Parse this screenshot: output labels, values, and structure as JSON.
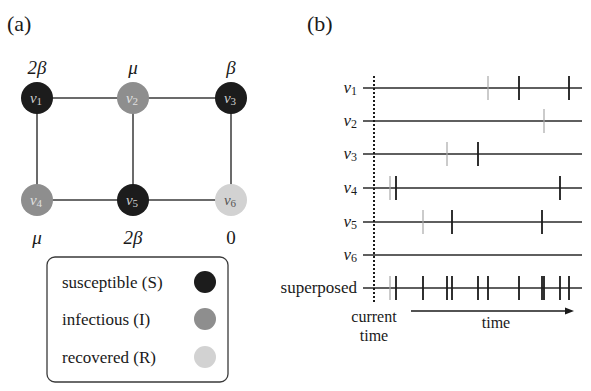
{
  "panel_a": {
    "label": "(a)",
    "colors": {
      "susceptible": "#1c1c1c",
      "infectious": "#8e8e8e",
      "recovered": "#d2d2d2",
      "edge": "#3a3a3a"
    },
    "nodes": [
      {
        "id": "v1",
        "name": "v",
        "sub": "1",
        "state": "susceptible",
        "x": 37,
        "y": 98,
        "rate": "2β",
        "rate_pos": "above"
      },
      {
        "id": "v2",
        "name": "v",
        "sub": "2",
        "state": "infectious",
        "x": 133,
        "y": 98,
        "rate": "μ",
        "rate_pos": "above"
      },
      {
        "id": "v3",
        "name": "v",
        "sub": "3",
        "state": "susceptible",
        "x": 231,
        "y": 98,
        "rate": "β",
        "rate_pos": "above"
      },
      {
        "id": "v4",
        "name": "v",
        "sub": "4",
        "state": "infectious",
        "x": 37,
        "y": 200,
        "rate": "μ",
        "rate_pos": "below"
      },
      {
        "id": "v5",
        "name": "v",
        "sub": "5",
        "state": "susceptible",
        "x": 133,
        "y": 200,
        "rate": "2β",
        "rate_pos": "below"
      },
      {
        "id": "v6",
        "name": "v",
        "sub": "6",
        "state": "recovered",
        "x": 231,
        "y": 200,
        "rate": "0",
        "rate_pos": "below"
      }
    ],
    "edges": [
      [
        "v1",
        "v2"
      ],
      [
        "v2",
        "v3"
      ],
      [
        "v1",
        "v4"
      ],
      [
        "v2",
        "v5"
      ],
      [
        "v3",
        "v6"
      ],
      [
        "v4",
        "v5"
      ],
      [
        "v5",
        "v6"
      ]
    ],
    "legend": [
      {
        "label": "susceptible (S)",
        "state": "susceptible"
      },
      {
        "label": "infectious (I)",
        "state": "infectious"
      },
      {
        "label": "recovered (R)",
        "state": "recovered"
      }
    ]
  },
  "panel_b": {
    "label": "(b)",
    "current_time_label_1": "current",
    "current_time_label_2": "time",
    "time_label": "time",
    "rows": [
      {
        "name": "v",
        "sub": "1",
        "y": 88,
        "ticks": [
          {
            "x": 488,
            "type": "gray"
          },
          {
            "x": 519,
            "type": "black"
          },
          {
            "x": 569,
            "type": "black"
          }
        ]
      },
      {
        "name": "v",
        "sub": "2",
        "y": 121,
        "ticks": [
          {
            "x": 544,
            "type": "gray"
          }
        ]
      },
      {
        "name": "v",
        "sub": "3",
        "y": 154,
        "ticks": [
          {
            "x": 447,
            "type": "gray"
          },
          {
            "x": 478,
            "type": "black"
          }
        ]
      },
      {
        "name": "v",
        "sub": "4",
        "y": 188,
        "ticks": [
          {
            "x": 390,
            "type": "gray"
          },
          {
            "x": 396,
            "type": "black"
          },
          {
            "x": 560,
            "type": "black"
          }
        ]
      },
      {
        "name": "v",
        "sub": "5",
        "y": 222,
        "ticks": [
          {
            "x": 423,
            "type": "gray"
          },
          {
            "x": 452,
            "type": "black"
          },
          {
            "x": 542,
            "type": "black"
          }
        ]
      },
      {
        "name": "v",
        "sub": "6",
        "y": 255,
        "ticks": []
      },
      {
        "name": "superposed",
        "sub": "",
        "y": 288,
        "ticks": [
          {
            "x": 390,
            "type": "gray"
          },
          {
            "x": 396,
            "type": "black"
          },
          {
            "x": 423,
            "type": "black"
          },
          {
            "x": 447,
            "type": "black"
          },
          {
            "x": 452,
            "type": "black"
          },
          {
            "x": 478,
            "type": "black"
          },
          {
            "x": 488,
            "type": "black"
          },
          {
            "x": 519,
            "type": "black"
          },
          {
            "x": 542,
            "type": "black"
          },
          {
            "x": 544,
            "type": "black"
          },
          {
            "x": 560,
            "type": "black"
          },
          {
            "x": 569,
            "type": "black"
          }
        ]
      }
    ]
  }
}
